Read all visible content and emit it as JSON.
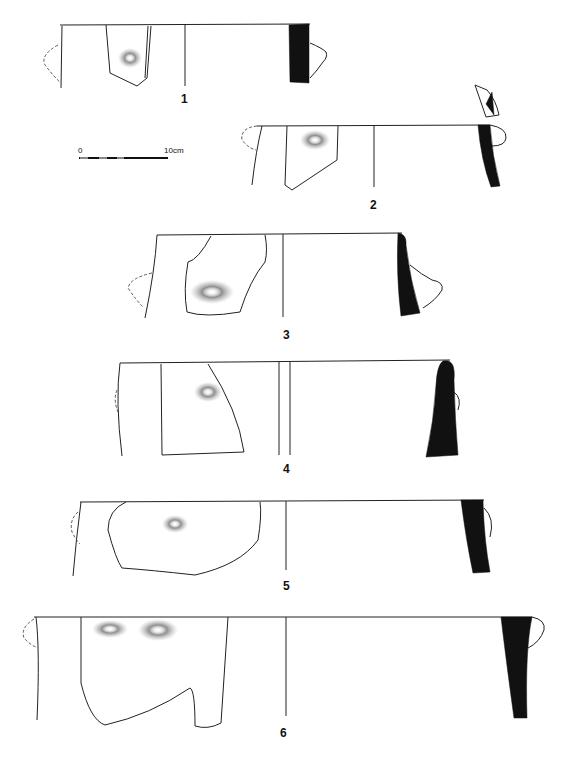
{
  "figure": {
    "type": "archaeological pottery profile drawings",
    "items": [
      {
        "label": "1"
      },
      {
        "label": "2"
      },
      {
        "label": "3"
      },
      {
        "label": "4"
      },
      {
        "label": "5"
      },
      {
        "label": "6"
      }
    ],
    "scale_bar": {
      "start_label": "0",
      "end_label": "10cm"
    }
  },
  "colors": {
    "section_fill": "#111111",
    "line": "#222222",
    "background": "#ffffff"
  }
}
